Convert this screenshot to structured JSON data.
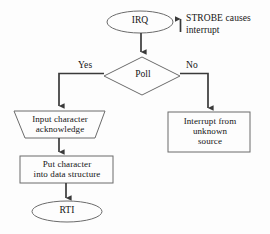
{
  "diagram": {
    "background_color": "#fdfdfd",
    "line_color": "#3a3a3a",
    "shape_outline_color": "#6b6b6b",
    "text_color": "#141414"
  },
  "nodes": {
    "irq": {
      "label": "IRQ",
      "shape": "ellipse"
    },
    "poll": {
      "label": "Poll",
      "shape": "diamond"
    },
    "input_character": {
      "label": "Input character\nacknowledge",
      "shape": "trapezoid"
    },
    "put_character": {
      "label": "Put character\ninto data structure",
      "shape": "rectangle"
    },
    "rti": {
      "label": "RTI",
      "shape": "ellipse"
    },
    "interrupt_unknown": {
      "label": "Interrupt from\nunknown\nsource",
      "shape": "rectangle"
    }
  },
  "edges": {
    "yes_label": "Yes",
    "no_label": "No"
  },
  "annotations": {
    "strobe_note": "STROBE causes\ninterrupt",
    "strobe_arrow_icon": "up-arrow-icon"
  }
}
